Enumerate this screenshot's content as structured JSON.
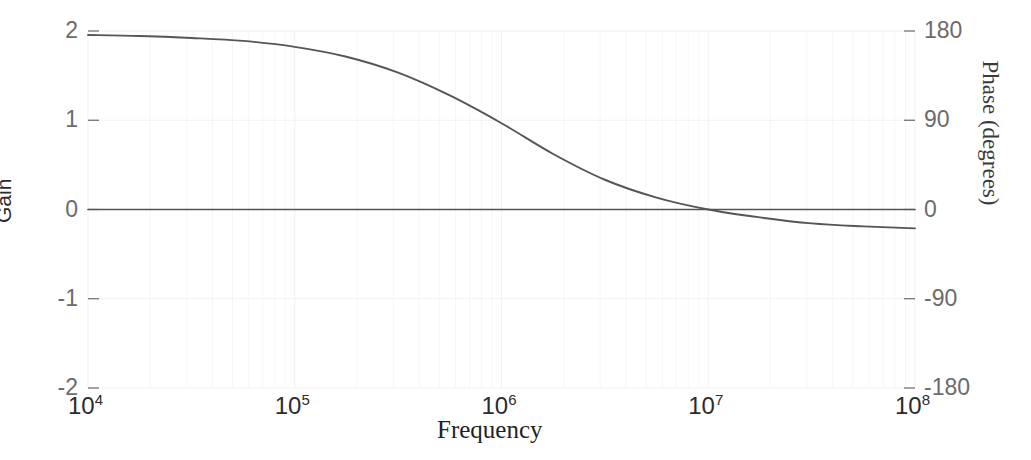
{
  "chart_data": {
    "type": "line",
    "title": "",
    "xlabel": "Frequency",
    "ylabel": "Gain",
    "y2label": "Phase (degrees)",
    "xscale": "log",
    "xlim": [
      10000,
      100000000
    ],
    "xticks": [
      {
        "value": 10000,
        "mantissa": "10",
        "exponent": "4"
      },
      {
        "value": 100000,
        "mantissa": "10",
        "exponent": "5"
      },
      {
        "value": 1000000,
        "mantissa": "10",
        "exponent": "6"
      },
      {
        "value": 10000000,
        "mantissa": "10",
        "exponent": "7"
      },
      {
        "value": 100000000,
        "mantissa": "10",
        "exponent": "8"
      }
    ],
    "ylim": [
      -2,
      2
    ],
    "yticks": [
      "2",
      "1",
      "0",
      "-1",
      "-2"
    ],
    "y2lim": [
      -180,
      180
    ],
    "y2ticks": [
      "180",
      "90",
      "0",
      "-90",
      "-180"
    ],
    "grid": true,
    "legend_position": "none",
    "line_color": "#555555",
    "grid_color": "#f2f2f2",
    "series": [
      {
        "name": "Gain",
        "axis": "left",
        "units": "",
        "x": [
          10000,
          31623,
          100000,
          316228,
          1000000,
          3162278,
          10000000,
          31622777,
          100000000
        ],
        "values": [
          0,
          0,
          0,
          0,
          0,
          0,
          0,
          0,
          0
        ]
      },
      {
        "name": "Phase",
        "axis": "right",
        "units": "degrees",
        "x": [
          10000,
          17783,
          31623,
          56234,
          100000,
          177828,
          316228,
          562341,
          1000000,
          1778279,
          3162278,
          5623413,
          10000000,
          17782794,
          31622777,
          56234133,
          100000000
        ],
        "values": [
          176,
          175,
          173,
          170,
          164,
          154,
          138,
          115,
          87,
          56,
          30,
          12,
          0,
          -8,
          -14,
          -17,
          -19
        ]
      }
    ]
  },
  "axes": {
    "gain_title": "Gain",
    "phase_title": "Phase (degrees)",
    "frequency_title": "Frequency"
  }
}
